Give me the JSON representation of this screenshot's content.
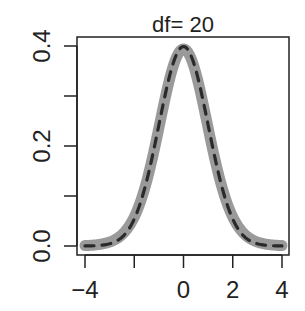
{
  "chart_data": {
    "type": "line",
    "title": "df= 20",
    "xlabel": "",
    "ylabel": "",
    "xlim": [
      -4,
      4
    ],
    "ylim": [
      0,
      0.4
    ],
    "x_ticks": [
      -4,
      -2,
      0,
      2,
      4
    ],
    "x_tick_labels": [
      "−4",
      "",
      "0",
      "2",
      "4"
    ],
    "y_ticks": [
      0.0,
      0.1,
      0.2,
      0.3,
      0.4
    ],
    "y_tick_labels": [
      "0.0",
      "",
      "0.2",
      "",
      "0.4"
    ],
    "grid": false,
    "legend": null,
    "series": [
      {
        "name": "t density (df=20)",
        "style": "thick-solid",
        "color": "#9a9a9a",
        "x": [
          -4,
          -3.5,
          -3,
          -2.5,
          -2,
          -1.5,
          -1,
          -0.5,
          0,
          0.5,
          1,
          1.5,
          2,
          2.5,
          3,
          3.5,
          4
        ],
        "values": [
          0.001,
          0.0029,
          0.0069,
          0.0185,
          0.0581,
          0.1284,
          0.236,
          0.3474,
          0.394,
          0.3474,
          0.236,
          0.1284,
          0.0581,
          0.0185,
          0.0069,
          0.0029,
          0.001
        ]
      },
      {
        "name": "normal density",
        "style": "dashed",
        "color": "#2a2a2a",
        "x": [
          -4,
          -3.5,
          -3,
          -2.5,
          -2,
          -1.5,
          -1,
          -0.5,
          0,
          0.5,
          1,
          1.5,
          2,
          2.5,
          3,
          3.5,
          4
        ],
        "values": [
          0.0001,
          0.0009,
          0.0044,
          0.0175,
          0.054,
          0.1295,
          0.242,
          0.3521,
          0.3989,
          0.3521,
          0.242,
          0.1295,
          0.054,
          0.0175,
          0.0044,
          0.0009,
          0.0001
        ]
      }
    ]
  },
  "colors": {
    "axis": "#222222",
    "thick_line": "#9a9a9a",
    "dashed_line": "#2a2a2a"
  }
}
